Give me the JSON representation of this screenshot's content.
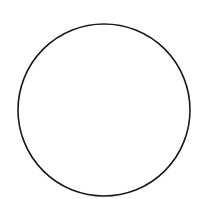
{
  "diagram": {
    "shape": "circle",
    "fill": "#ffffff",
    "stroke": "#1a1a1a",
    "stroke_width": 1.6,
    "center": {
      "x": 104,
      "y": 110
    },
    "radius": 86
  },
  "background": "#ffffff"
}
